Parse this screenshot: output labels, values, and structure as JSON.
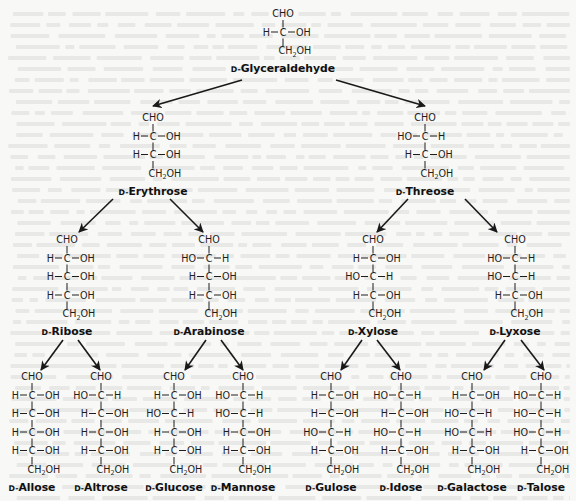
{
  "figure": {
    "prefix": "D-",
    "row_spacing": 18.5
  },
  "molecules": [
    {
      "id": "glyceraldehyde",
      "name": "Glyceraldehyde",
      "x": 283,
      "y": 17,
      "centers": [
        "R"
      ]
    },
    {
      "id": "erythrose",
      "name": "Erythrose",
      "x": 153,
      "y": 121,
      "centers": [
        "R",
        "R"
      ]
    },
    {
      "id": "threose",
      "name": "Threose",
      "x": 425,
      "y": 121,
      "centers": [
        "L",
        "R"
      ]
    },
    {
      "id": "ribose",
      "name": "Ribose",
      "x": 67,
      "y": 243,
      "centers": [
        "R",
        "R",
        "R"
      ]
    },
    {
      "id": "arabinose",
      "name": "Arabinose",
      "x": 209,
      "y": 243,
      "centers": [
        "L",
        "R",
        "R"
      ]
    },
    {
      "id": "xylose",
      "name": "Xylose",
      "x": 373,
      "y": 243,
      "centers": [
        "R",
        "L",
        "R"
      ]
    },
    {
      "id": "lyxose",
      "name": "Lyxose",
      "x": 515,
      "y": 243,
      "centers": [
        "L",
        "L",
        "R"
      ]
    },
    {
      "id": "allose",
      "name": "Allose",
      "x": 32,
      "y": 380,
      "centers": [
        "R",
        "R",
        "R",
        "R"
      ]
    },
    {
      "id": "altrose",
      "name": "Altrose",
      "x": 101,
      "y": 380,
      "centers": [
        "L",
        "R",
        "R",
        "R"
      ]
    },
    {
      "id": "glucose",
      "name": "Glucose",
      "x": 174,
      "y": 380,
      "centers": [
        "R",
        "L",
        "R",
        "R"
      ]
    },
    {
      "id": "mannose",
      "name": "Mannose",
      "x": 243,
      "y": 380,
      "centers": [
        "L",
        "L",
        "R",
        "R"
      ]
    },
    {
      "id": "gulose",
      "name": "Gulose",
      "x": 331,
      "y": 380,
      "centers": [
        "R",
        "R",
        "L",
        "R"
      ]
    },
    {
      "id": "idose",
      "name": "Idose",
      "x": 401,
      "y": 380,
      "centers": [
        "L",
        "R",
        "L",
        "R"
      ]
    },
    {
      "id": "galactose",
      "name": "Galactose",
      "x": 472,
      "y": 380,
      "centers": [
        "R",
        "L",
        "L",
        "R"
      ]
    },
    {
      "id": "talose",
      "name": "Talose",
      "x": 541,
      "y": 380,
      "centers": [
        "L",
        "L",
        "L",
        "R"
      ]
    }
  ],
  "groups": {
    "top": "CHO",
    "bottom_main": "CH",
    "bottom_sub": "2",
    "bottom_tail": "OH",
    "carbon": "C",
    "hydrogen": "H",
    "hydroxyl_right": "OH",
    "hydroxyl_left": "HO"
  },
  "arrows": [
    {
      "from": "glyceraldehyde",
      "to": "erythrose",
      "x1": 242,
      "y1": 80,
      "x2": 153,
      "y2": 106
    },
    {
      "from": "glyceraldehyde",
      "to": "threose",
      "x1": 336,
      "y1": 80,
      "x2": 425,
      "y2": 106
    },
    {
      "from": "erythrose",
      "to": "ribose",
      "x1": 113,
      "y1": 199,
      "x2": 79,
      "y2": 232
    },
    {
      "from": "erythrose",
      "to": "arabinose",
      "x1": 170,
      "y1": 199,
      "x2": 203,
      "y2": 232
    },
    {
      "from": "threose",
      "to": "xylose",
      "x1": 408,
      "y1": 199,
      "x2": 377,
      "y2": 232
    },
    {
      "from": "threose",
      "to": "lyxose",
      "x1": 465,
      "y1": 199,
      "x2": 497,
      "y2": 232
    },
    {
      "from": "ribose",
      "to": "allose",
      "x1": 63,
      "y1": 340,
      "x2": 41,
      "y2": 370
    },
    {
      "from": "ribose",
      "to": "altrose",
      "x1": 78,
      "y1": 340,
      "x2": 100,
      "y2": 370
    },
    {
      "from": "arabinose",
      "to": "glucose",
      "x1": 206,
      "y1": 340,
      "x2": 185,
      "y2": 370
    },
    {
      "from": "arabinose",
      "to": "mannose",
      "x1": 221,
      "y1": 340,
      "x2": 243,
      "y2": 370
    },
    {
      "from": "xylose",
      "to": "gulose",
      "x1": 362,
      "y1": 340,
      "x2": 341,
      "y2": 370
    },
    {
      "from": "xylose",
      "to": "idose",
      "x1": 377,
      "y1": 340,
      "x2": 400,
      "y2": 370
    },
    {
      "from": "lyxose",
      "to": "galactose",
      "x1": 505,
      "y1": 340,
      "x2": 484,
      "y2": 370
    },
    {
      "from": "lyxose",
      "to": "talose",
      "x1": 521,
      "y1": 340,
      "x2": 544,
      "y2": 370
    }
  ],
  "colors": {
    "ink": "#1a1a1a",
    "background": "#f8f8f7"
  }
}
